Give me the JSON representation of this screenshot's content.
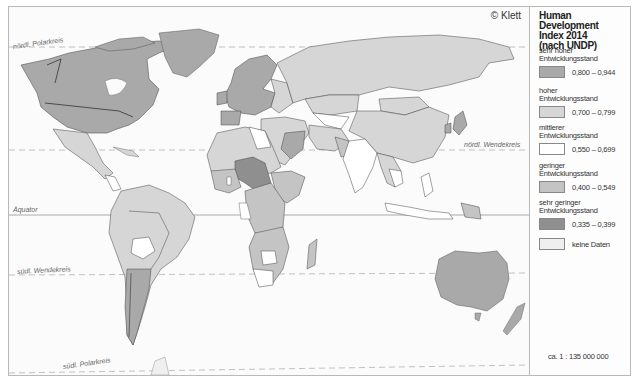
{
  "map": {
    "copyright": "© Klett",
    "lines": {
      "north_polar": "nördl. Polarkreis",
      "north_tropic": "nördl. Wendekreis",
      "equator": "Äquator",
      "south_tropic": "südl. Wendekreis",
      "south_polar": "südl. Polarkreis"
    },
    "colors": {
      "very_high": "#a9a9a9",
      "high": "#d6d6d6",
      "medium": "#ffffff",
      "low": "#c4c4c4",
      "very_low": "#8f8f8f",
      "no_data": "#efefef",
      "border": "#444444",
      "ocean": "#fbfbfb"
    }
  },
  "legend": {
    "title": "Human Development Index 2014 (nach UNDP)",
    "title_lines": [
      "Human Development",
      "Index 2014",
      "(nach UNDP)"
    ],
    "items": [
      {
        "category": "sehr hoher Entwicklungsstand",
        "cat_lines": [
          "sehr hoher",
          "Entwicklungsstand"
        ],
        "range": "0,800 – 0,944",
        "color": "#a9a9a9"
      },
      {
        "category": "hoher Entwicklungsstand",
        "cat_lines": [
          "hoher",
          "Entwicklungsstand"
        ],
        "range": "0,700 – 0,799",
        "color": "#d6d6d6"
      },
      {
        "category": "mittlerer Entwicklungsstand",
        "cat_lines": [
          "mittlerer",
          "Entwicklungsstand"
        ],
        "range": "0,550 – 0,699",
        "color": "#ffffff"
      },
      {
        "category": "geringer Entwicklungsstand",
        "cat_lines": [
          "geringer",
          "Entwicklungsstand"
        ],
        "range": "0,400 – 0,549",
        "color": "#c4c4c4"
      },
      {
        "category": "sehr geringer Entwicklungsstand",
        "cat_lines": [
          "sehr geringer",
          "Entwicklungsstand"
        ],
        "range": "0,335 – 0,399",
        "color": "#8f8f8f"
      },
      {
        "category": "",
        "cat_lines": [],
        "range": "keine Daten",
        "color": "#efefef"
      }
    ],
    "scale": "ca. 1 : 135 000 000"
  }
}
